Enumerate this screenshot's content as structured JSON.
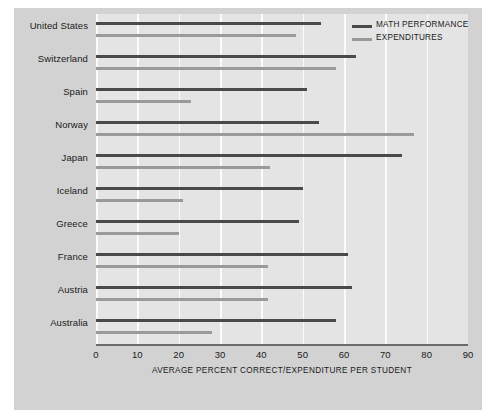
{
  "chart_data": {
    "type": "bar",
    "orientation": "horizontal",
    "title": "",
    "xlabel": "AVERAGE PERCENT CORRECT/EXPENDITURE PER STUDENT",
    "ylabel": "",
    "xlim": [
      0,
      90
    ],
    "xticks": [
      0,
      10,
      20,
      30,
      40,
      50,
      60,
      70,
      80,
      90
    ],
    "grid": true,
    "legend_position": "top-right",
    "categories": [
      "United States",
      "Switzerland",
      "Spain",
      "Norway",
      "Japan",
      "Iceland",
      "Greece",
      "France",
      "Austria",
      "Australia"
    ],
    "series": [
      {
        "name": "MATH PERFORMANCE",
        "color": "#4a4a4a",
        "values": [
          54.5,
          63,
          51,
          54,
          74,
          50,
          49,
          61,
          62,
          58
        ]
      },
      {
        "name": "EXPENDITURES",
        "color": "#9a9a9a",
        "values": [
          48.5,
          58,
          23,
          77,
          42,
          21,
          20,
          41.5,
          41.5,
          28
        ]
      }
    ]
  },
  "legend": {
    "items": [
      {
        "label": "MATH PERFORMANCE",
        "swatch": "math"
      },
      {
        "label": "EXPENDITURES",
        "swatch": "exp"
      }
    ]
  }
}
